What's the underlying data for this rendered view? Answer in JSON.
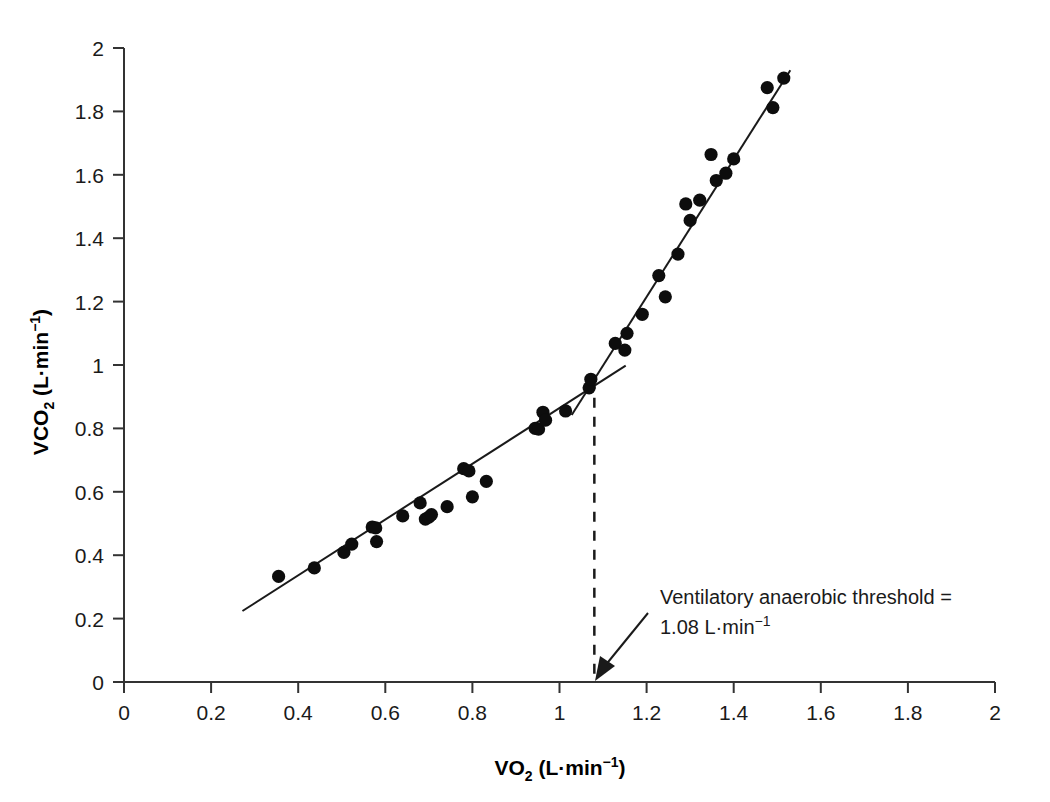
{
  "chart_data": {
    "type": "scatter",
    "title": "",
    "xlabel": "VO2 (L·min⁻¹)",
    "ylabel": "VCO2 (L·min⁻¹)",
    "xlim": [
      0,
      2
    ],
    "ylim": [
      0,
      2
    ],
    "xticks": [
      0,
      0.2,
      0.4,
      0.6,
      0.8,
      1,
      1.2,
      1.4,
      1.6,
      1.8,
      2
    ],
    "xtick_labels": [
      "0",
      "0.2",
      "0.4",
      "0.6",
      "0.8",
      "1",
      "1.2",
      "1.4",
      "1.6",
      "1.8",
      "2"
    ],
    "yticks": [
      0,
      0.2,
      0.4,
      0.6,
      0.8,
      1,
      1.2,
      1.4,
      1.6,
      1.8,
      2
    ],
    "ytick_labels": [
      "0",
      "0.2",
      "0.4",
      "0.6",
      "0.8",
      "1",
      "1.2",
      "1.4",
      "1.6",
      "1.8",
      "2"
    ],
    "grid": false,
    "legend": false,
    "marker_color": "#0d0d0d",
    "line_color": "#1a1a1a",
    "series": [
      {
        "name": "VCO2 vs VO2",
        "marker": "filled-circle",
        "points": [
          [
            0.355,
            0.333
          ],
          [
            0.437,
            0.36
          ],
          [
            0.505,
            0.409
          ],
          [
            0.523,
            0.435
          ],
          [
            0.57,
            0.489
          ],
          [
            0.578,
            0.486
          ],
          [
            0.58,
            0.443
          ],
          [
            0.64,
            0.524
          ],
          [
            0.68,
            0.565
          ],
          [
            0.692,
            0.514
          ],
          [
            0.7,
            0.52
          ],
          [
            0.706,
            0.528
          ],
          [
            0.742,
            0.553
          ],
          [
            0.78,
            0.673
          ],
          [
            0.792,
            0.666
          ],
          [
            0.8,
            0.584
          ],
          [
            0.832,
            0.633
          ],
          [
            0.944,
            0.8
          ],
          [
            0.952,
            0.798
          ],
          [
            0.962,
            0.851
          ],
          [
            0.968,
            0.826
          ],
          [
            1.014,
            0.855
          ],
          [
            1.068,
            0.928
          ],
          [
            1.072,
            0.955
          ],
          [
            1.128,
            1.068
          ],
          [
            1.15,
            1.047
          ],
          [
            1.155,
            1.1
          ],
          [
            1.19,
            1.16
          ],
          [
            1.228,
            1.282
          ],
          [
            1.243,
            1.215
          ],
          [
            1.272,
            1.35
          ],
          [
            1.29,
            1.508
          ],
          [
            1.3,
            1.456
          ],
          [
            1.322,
            1.52
          ],
          [
            1.348,
            1.664
          ],
          [
            1.36,
            1.582
          ],
          [
            1.382,
            1.605
          ],
          [
            1.4,
            1.65
          ],
          [
            1.477,
            1.875
          ],
          [
            1.49,
            1.812
          ],
          [
            1.515,
            1.905
          ]
        ]
      }
    ],
    "fit_lines": [
      {
        "name": "below-threshold-slope",
        "x1": 0.272,
        "y1": 0.224,
        "x2": 1.152,
        "y2": 0.998
      },
      {
        "name": "above-threshold-slope",
        "x1": 1.028,
        "y1": 0.842,
        "x2": 1.53,
        "y2": 1.93
      }
    ],
    "threshold": {
      "value": 1.08,
      "unit": "L·min⁻¹",
      "breakpoint_x": 1.08,
      "breakpoint_y": 0.957,
      "dashed_line": true
    },
    "annotations": [
      {
        "name": "ventilatory-anaerobic-threshold",
        "line1": "Ventilatory anaerobic threshold =",
        "line2_value": "1.08",
        "line2_unit": "L·min",
        "line2_exponent": "−1",
        "arrow": true
      }
    ]
  },
  "axes": {
    "x_title_main": "VO",
    "x_title_sub": "2",
    "x_title_unit": " (L·min",
    "x_title_sup": "−1",
    "x_title_close": ")",
    "y_title_main": "VCO",
    "y_title_sub": "2",
    "y_title_unit": " (L·min",
    "y_title_sup": "−1",
    "y_title_close": ")"
  }
}
